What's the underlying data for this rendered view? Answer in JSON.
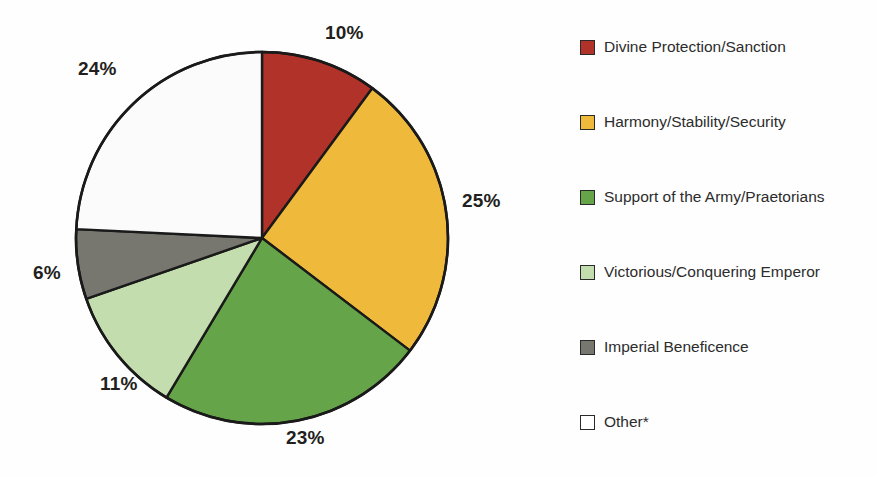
{
  "chart_data": {
    "type": "pie",
    "title": "",
    "subtitle": "",
    "xlabel": "",
    "ylabel": "",
    "grid": false,
    "legend_position": "right",
    "start_angle_deg": 0,
    "direction": "clockwise",
    "categories": [
      "Divine Protection/Sanction",
      "Harmony/Stability/Security",
      "Support of the Army/Praetorians",
      "Victorious/Conquering Emperor",
      "Imperial Beneficence",
      "Other*"
    ],
    "values": [
      10,
      25,
      23,
      11,
      6,
      24
    ],
    "value_labels": [
      "10%",
      "25%",
      "23%",
      "11%",
      "6%",
      "24%"
    ],
    "units": "percent",
    "colors": [
      "#b03228",
      "#efba3c",
      "#66a44a",
      "#c3ddaf",
      "#77776f",
      "#fbfbfb"
    ],
    "slice_outline_color": "#1a1a1a",
    "slices": [
      {
        "label": "Divine Protection/Sanction",
        "value": 10,
        "value_label": "10%",
        "color": "#b03228"
      },
      {
        "label": "Harmony/Stability/Security",
        "value": 25,
        "value_label": "25%",
        "color": "#efba3c"
      },
      {
        "label": "Support of the Army/Praetorians",
        "value": 23,
        "value_label": "23%",
        "color": "#66a44a"
      },
      {
        "label": "Victorious/Conquering Emperor",
        "value": 11,
        "value_label": "11%",
        "color": "#c3ddaf"
      },
      {
        "label": "Imperial Beneficence",
        "value": 6,
        "value_label": "6%",
        "color": "#77776f"
      },
      {
        "label": "Other*",
        "value": 24,
        "value_label": "24%",
        "color": "#fbfbfb"
      }
    ]
  },
  "pie": {
    "labels": [
      {
        "text": "10%",
        "x": 325,
        "y": 22
      },
      {
        "text": "25%",
        "x": 462,
        "y": 190
      },
      {
        "text": "23%",
        "x": 286,
        "y": 427
      },
      {
        "text": "11%",
        "x": 100,
        "y": 373
      },
      {
        "text": "6%",
        "x": 33,
        "y": 262
      },
      {
        "text": "24%",
        "x": 78,
        "y": 58
      }
    ]
  },
  "legend": {
    "items": [
      {
        "label": "Divine Protection/Sanction",
        "color": "#b03228",
        "y": 36
      },
      {
        "label": "Harmony/Stability/Security",
        "color": "#efba3c",
        "y": 111
      },
      {
        "label": "Support of the Army/Praetorians",
        "color": "#66a44a",
        "y": 186
      },
      {
        "label": "Victorious/Conquering Emperor",
        "color": "#c3ddaf",
        "y": 261
      },
      {
        "label": "Imperial Beneficence",
        "color": "#77776f",
        "y": 336
      },
      {
        "label": "Other*",
        "color": "#ffffff",
        "y": 411
      }
    ]
  }
}
